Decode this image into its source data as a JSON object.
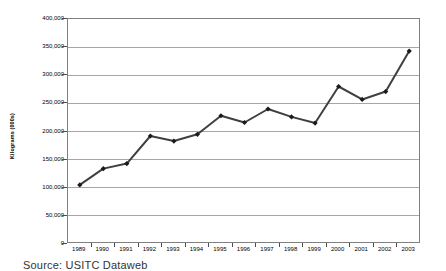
{
  "chart_data": {
    "type": "line",
    "title": "",
    "xlabel": "",
    "ylabel": "Kilograms (000s)",
    "categories": [
      "1989",
      "1990",
      "1991",
      "1992",
      "1993",
      "1994",
      "1995",
      "1996",
      "1997",
      "1998",
      "1999",
      "2000",
      "2001",
      "2002",
      "2003"
    ],
    "values": [
      105000,
      134000,
      143000,
      192000,
      183000,
      195000,
      228000,
      216000,
      240000,
      226000,
      215000,
      280000,
      257000,
      271000,
      343000
    ],
    "series": [
      {
        "name": "Kilograms (000s)",
        "values": [
          105000,
          134000,
          143000,
          192000,
          183000,
          195000,
          228000,
          216000,
          240000,
          226000,
          215000,
          280000,
          257000,
          271000,
          343000
        ]
      }
    ],
    "ylim": [
      0,
      400000
    ],
    "ytick_values": [
      0,
      50000,
      100000,
      150000,
      200000,
      250000,
      300000,
      350000,
      400000
    ],
    "ytick_labels": [
      "0",
      "50,000",
      "100,000",
      "150,000",
      "200,000",
      "250,000",
      "300,000",
      "350,000",
      "400,000"
    ],
    "grid": true,
    "legend": "none",
    "marker": "diamond",
    "line_color": "#404040",
    "marker_color": "#1a1a1a",
    "gridline_color": "#a6a6a6",
    "frame_color": "#808080"
  },
  "caption": {
    "source_note": "Source:  USITC Dataweb"
  }
}
